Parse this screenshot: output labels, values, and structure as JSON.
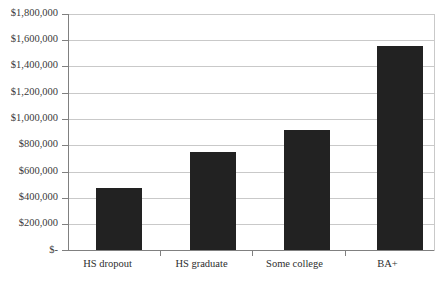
{
  "chart_data": {
    "type": "bar",
    "title": "",
    "xlabel": "",
    "ylabel": "",
    "categories": [
      "HS dropout",
      "HS graduate",
      "Some college",
      "BA+"
    ],
    "values": [
      470000,
      745000,
      915000,
      1555000
    ],
    "ylim": [
      0,
      1800000
    ],
    "ytick_values": [
      0,
      200000,
      400000,
      600000,
      800000,
      1000000,
      1200000,
      1400000,
      1600000,
      1800000
    ],
    "ytick_labels": [
      "$-",
      "$200,000",
      "$400,000",
      "$600,000",
      "$800,000",
      "$1,000,000",
      "$1,200,000",
      "$1,400,000",
      "$1,600,000",
      "$1,800,000"
    ],
    "grid": true,
    "legend": false,
    "legend_position": "none",
    "bar_color": "#222222",
    "gridline_color": "#c9c9c9",
    "axis_color": "#808080",
    "background_color": "#ffffff"
  }
}
